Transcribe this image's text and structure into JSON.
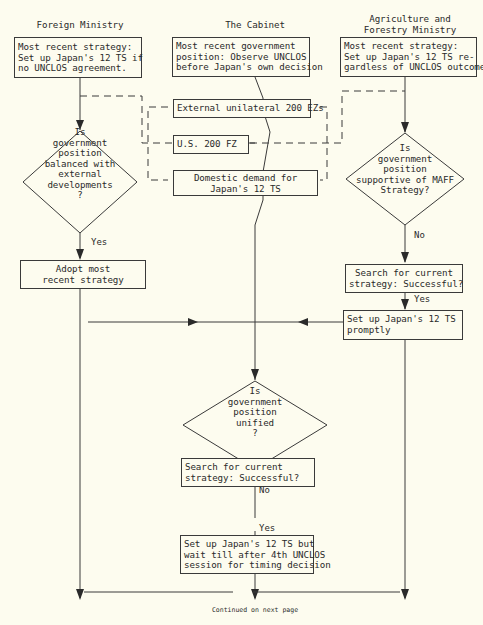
{
  "diagram": {
    "columns": {
      "foreign_ministry": "Foreign Ministry",
      "cabinet": "The Cabinet",
      "agriculture": "Agriculture and\nForestry Ministry"
    },
    "foreign_ministry": {
      "strategy_box": "Most recent strategy:\nSet up Japan's 12 TS if\nno UNCLOS agreement.",
      "decision": "Is\ngovernment\nposition\nbalanced with\nexternal\ndevelopments\n?",
      "yes_label": "Yes",
      "action_box": "Adopt most\nrecent strategy"
    },
    "cabinet": {
      "position_box": "Most recent government\nposition: Observe UNCLOS\nbefore Japan's own decision",
      "factor_1": "External unilateral 200 EZs",
      "factor_2": "U.S. 200 FZ",
      "factor_3": "Domestic demand for\nJapan's 12 TS",
      "decision": "Is\ngovernment\nposition\nunified\n?",
      "no_label": "No",
      "search_box": "Search for current\nstrategy: Successful?",
      "yes_label": "Yes",
      "action_box": "Set up Japan's 12 TS but\nwait till after 4th UNCLOS\nsession for timing decision"
    },
    "agriculture": {
      "strategy_box": "Most recent strategy:\nSet up Japan's 12 TS re-\ngardless of UNCLOS outcome",
      "decision": "Is\ngovernment\nposition\nsupportive of MAFF\nStrategy?",
      "no_label": "No",
      "search_box": "Search for current\nstrategy: Successful?",
      "yes_label": "Yes",
      "action_box": "Set up Japan's 12 TS\npromptly"
    },
    "footer": "Continued on next page"
  },
  "colors": {
    "background": "#fdfcef",
    "line": "#3a3a3a"
  }
}
